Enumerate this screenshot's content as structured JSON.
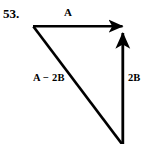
{
  "figure": {
    "problem_number": "53.",
    "background_color": "#ffffff",
    "stroke_color": "#000000",
    "labels": {
      "horizontal_vector": "A",
      "diagonal_vector": "A − 2B",
      "vertical_vector": "2B"
    },
    "geometry": {
      "apex": {
        "x": 33,
        "y": 26
      },
      "horizontal_arrow": {
        "x1": 33,
        "y1": 26,
        "x2": 126,
        "y2": 26
      },
      "vertical_arrow": {
        "x1": 123,
        "y1": 144,
        "x2": 123,
        "y2": 28
      },
      "diagonal_line": {
        "x1": 33,
        "y1": 27,
        "x2": 122,
        "y2": 144
      },
      "stroke_width": 2.6
    }
  }
}
